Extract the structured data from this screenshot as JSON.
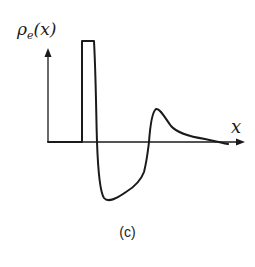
{
  "figure": {
    "y_axis_label_symbol": "ρ",
    "y_axis_label_subscript": "e",
    "y_axis_label_arg": "(x)",
    "x_axis_label": "x",
    "caption": "(c)",
    "colors": {
      "curve": "#1a1a1a",
      "axes": "#1a1a1a",
      "background": "#ffffff"
    }
  }
}
